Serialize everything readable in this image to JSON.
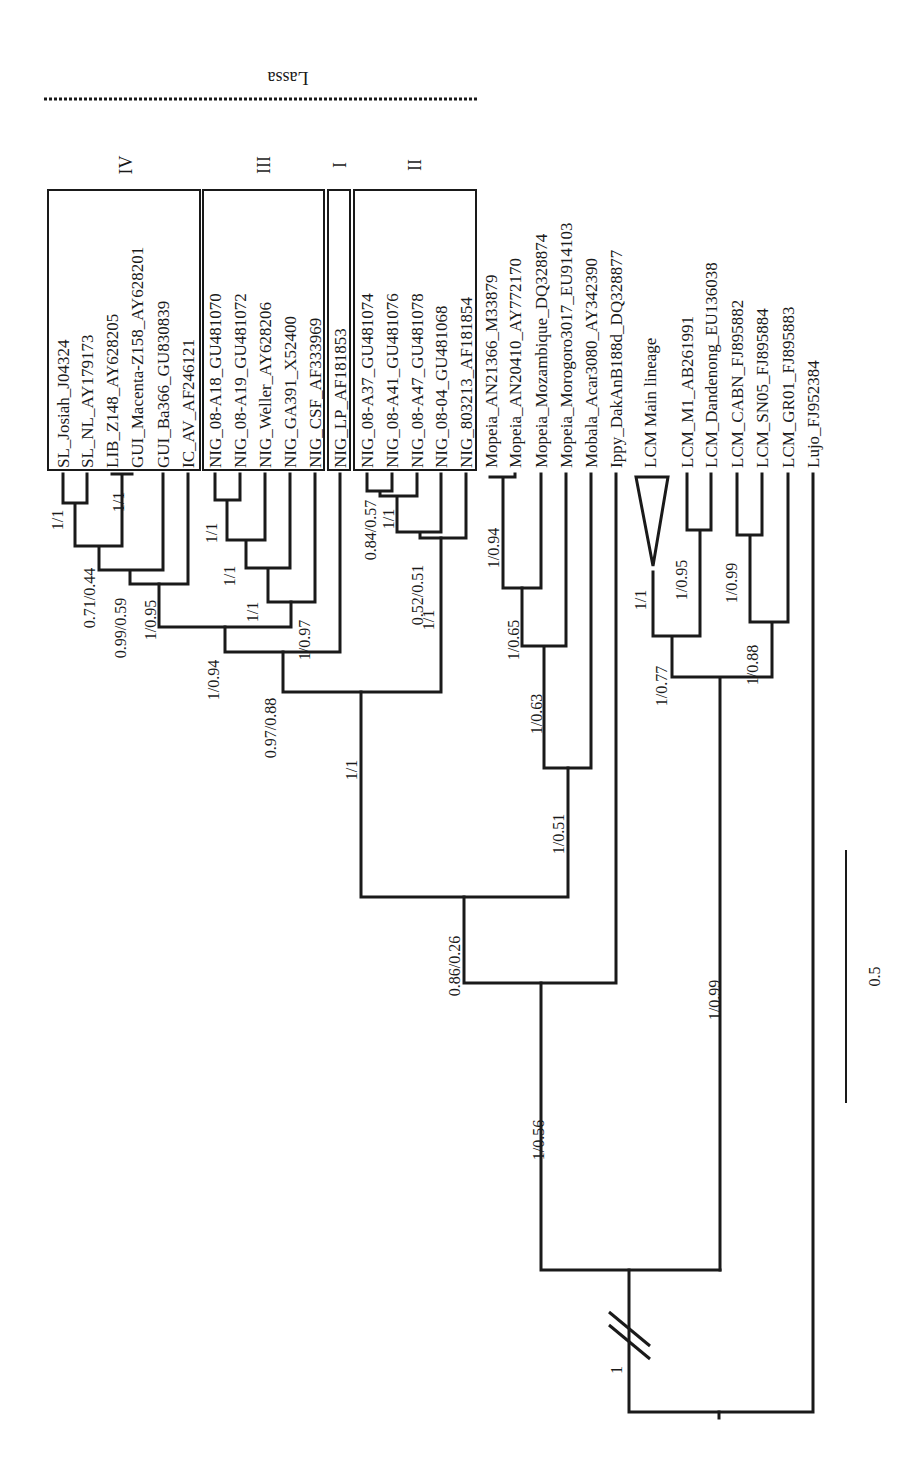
{
  "figure": {
    "type": "phylogenetic-tree",
    "orientation": "rotated-90-ccw",
    "line_color": "#1a1a1a",
    "background": "#ffffff"
  },
  "group_label": "Lassa",
  "lineages": [
    {
      "id": "IV",
      "label": "IV",
      "box": [
        48,
        190,
        200,
        470
      ],
      "label_x": 126
    },
    {
      "id": "III",
      "label": "III",
      "box": [
        203,
        190,
        324,
        470
      ],
      "label_x": 264
    },
    {
      "id": "I",
      "label": "I",
      "box": [
        328,
        190,
        350,
        470
      ],
      "label_x": 340
    },
    {
      "id": "II",
      "label": "II",
      "box": [
        354,
        190,
        476,
        470
      ],
      "label_x": 415
    }
  ],
  "tips": [
    {
      "label": "SL_Josiah_J04324",
      "x": 63
    },
    {
      "label": "SL_NL_AY179173",
      "x": 87
    },
    {
      "label": "LIB_Z148_AY628205",
      "x": 112
    },
    {
      "label": "GUI_Macenta-Z158_AY628201",
      "x": 137
    },
    {
      "label": "GUI_Ba366_GU830839",
      "x": 163
    },
    {
      "label": "IC_AV_AF246121",
      "x": 188
    },
    {
      "label": "NIG_08-A18_GU481070",
      "x": 215
    },
    {
      "label": "NIG_08-A19_GU481072",
      "x": 240
    },
    {
      "label": "NIG_Weller_AY628206",
      "x": 265
    },
    {
      "label": "NIG_GA391_X52400",
      "x": 290
    },
    {
      "label": "NIG_CSF_AF333969",
      "x": 315
    },
    {
      "label": "NIG_LP_AF181853",
      "x": 340
    },
    {
      "label": "NIG_08-A37_GU481074",
      "x": 367
    },
    {
      "label": "NIG_08-A41_GU481076",
      "x": 392
    },
    {
      "label": "NIG_08-A47_GU481078",
      "x": 417
    },
    {
      "label": "NIG_08-04_GU481068",
      "x": 441
    },
    {
      "label": "NIG_803213_AF181854",
      "x": 466
    },
    {
      "label": "Mopeia_AN21366_M33879",
      "x": 491
    },
    {
      "label": "Mopeia_AN20410_AY772170",
      "x": 515
    },
    {
      "label": "Mopeia_Mozambique_DQ328874",
      "x": 541
    },
    {
      "label": "Mopeia_Morogoro3017_EU914103",
      "x": 566
    },
    {
      "label": "Mobala_Acar3080_AY342390",
      "x": 591
    },
    {
      "label": "Ippy_DakAnB188d_DQ328877",
      "x": 616
    },
    {
      "label": "LCM Main lineage",
      "x": 650
    },
    {
      "label": "LCM_M1_AB261991",
      "x": 687
    },
    {
      "label": "LCM_Dandenong_EU136038",
      "x": 711
    },
    {
      "label": "LCM_CABN_FJ895882",
      "x": 737
    },
    {
      "label": "LCM_SN05_FJ895884",
      "x": 762
    },
    {
      "label": "LCM_GR01_FJ895883",
      "x": 788
    },
    {
      "label": "Lujo_FJ952384",
      "x": 813
    }
  ],
  "support_values": [
    {
      "label": "1/1",
      "x": 58,
      "y": 520
    },
    {
      "label": "0.71/0.44",
      "x": 90,
      "y": 598
    },
    {
      "label": "1/1",
      "x": 119,
      "y": 502
    },
    {
      "label": "0.99/0.59",
      "x": 121,
      "y": 628
    },
    {
      "label": "1/0.95",
      "x": 151,
      "y": 620
    },
    {
      "label": "1/0.94",
      "x": 214,
      "y": 680
    },
    {
      "label": "1/1",
      "x": 212,
      "y": 533
    },
    {
      "label": "1/1",
      "x": 230,
      "y": 576
    },
    {
      "label": "1/1",
      "x": 253,
      "y": 612
    },
    {
      "label": "1/0.97",
      "x": 305,
      "y": 640
    },
    {
      "label": "0.97/0.88",
      "x": 271,
      "y": 728
    },
    {
      "label": "0.84/0.57",
      "x": 371,
      "y": 530
    },
    {
      "label": "1/1",
      "x": 389,
      "y": 519
    },
    {
      "label": "0.52/0.51",
      "x": 418,
      "y": 595
    },
    {
      "label": "1/1",
      "x": 429,
      "y": 620
    },
    {
      "label": "1/1",
      "x": 352,
      "y": 770
    },
    {
      "label": "1/0.94",
      "x": 494,
      "y": 548
    },
    {
      "label": "1/0.65",
      "x": 514,
      "y": 640
    },
    {
      "label": "1/0.63",
      "x": 537,
      "y": 714
    },
    {
      "label": "1/0.51",
      "x": 559,
      "y": 834
    },
    {
      "label": "0.86/0.26",
      "x": 455,
      "y": 966
    },
    {
      "label": "1/0.56",
      "x": 539,
      "y": 1140
    },
    {
      "label": "1/1",
      "x": 641,
      "y": 600
    },
    {
      "label": "1/0.95",
      "x": 682,
      "y": 580
    },
    {
      "label": "1/0.77",
      "x": 662,
      "y": 686
    },
    {
      "label": "1/0.99",
      "x": 732,
      "y": 583
    },
    {
      "label": "1/0.88",
      "x": 753,
      "y": 665
    },
    {
      "label": "1/0.99",
      "x": 715,
      "y": 1000
    },
    {
      "label": "1",
      "x": 617,
      "y": 1370
    }
  ],
  "scale_bar": {
    "label": "0.5",
    "x": 846,
    "y1": 850,
    "y2": 1103
  }
}
